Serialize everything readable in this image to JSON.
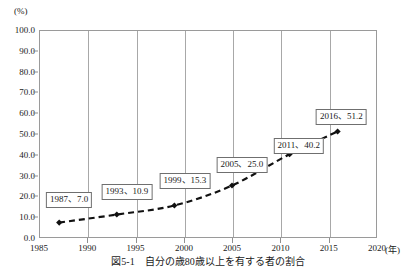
{
  "chart_data": {
    "type": "line",
    "title": "",
    "caption": "図5-1　自分の歳80歳以上を有する者の割合",
    "xlabel": "年",
    "ylabel": "%",
    "xunit_label": "(年)",
    "yunit_label": "(%)",
    "xlim": [
      1985,
      2020
    ],
    "ylim": [
      0,
      100
    ],
    "xticks": [
      "1985",
      "1990",
      "1995",
      "2000",
      "2005",
      "2010",
      "2015",
      "2020"
    ],
    "xtick_values": [
      1985,
      1990,
      1995,
      2000,
      2005,
      2010,
      2015,
      2020
    ],
    "yticks": [
      "0.0",
      "10.0",
      "20.0",
      "30.0",
      "40.0",
      "50.0",
      "60.0",
      "70.0",
      "80.0",
      "90.0",
      "100.0"
    ],
    "ytick_values": [
      0,
      10,
      20,
      30,
      40,
      50,
      60,
      70,
      80,
      90,
      100
    ],
    "grid": "vertical",
    "legend": "none",
    "line_style": "dashed",
    "line_color": "#111111",
    "marker": "diamond",
    "marker_color": "#111111",
    "x": [
      1987,
      1993,
      1999,
      2005,
      2011,
      2016
    ],
    "values": [
      7.0,
      10.9,
      15.3,
      25.0,
      40.2,
      51.2
    ],
    "point_labels": [
      "1987、7.0",
      "1993、10.9",
      "1999、15.3",
      "2005、25.0",
      "2011、40.2",
      "2016、51.2"
    ],
    "annotations": [
      {
        "label": "1987、7.0",
        "x": 1987,
        "y": 7.0,
        "box_x": 1988.0,
        "box_y": 19.0
      },
      {
        "label": "1993、10.9",
        "x": 1993,
        "y": 10.9,
        "box_x": 1994.0,
        "box_y": 22.5
      },
      {
        "label": "1999、15.3",
        "x": 1999,
        "y": 15.3,
        "box_x": 2000.0,
        "box_y": 28.0
      },
      {
        "label": "2005、25.0",
        "x": 2005,
        "y": 25.0,
        "box_x": 2005.9,
        "box_y": 35.5
      },
      {
        "label": "2011、40.2",
        "x": 2011,
        "y": 40.2,
        "box_x": 2011.8,
        "box_y": 44.5
      },
      {
        "label": "2016、51.2",
        "x": 2016,
        "y": 51.2,
        "box_x": 2016.2,
        "box_y": 58.5
      }
    ]
  }
}
